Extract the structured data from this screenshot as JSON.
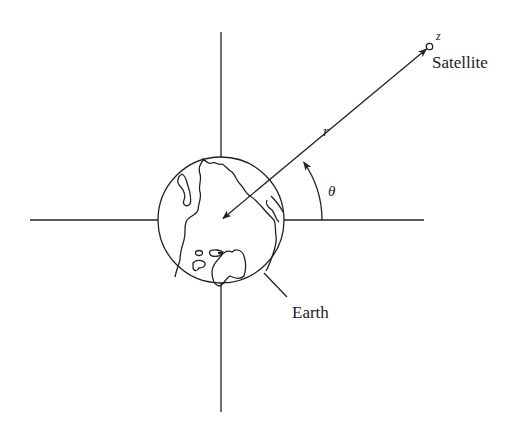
{
  "diagram": {
    "type": "satellite-geometry",
    "labels": {
      "satellite": "Satellite",
      "z": "z",
      "r": "r",
      "theta": "θ",
      "earth": "Earth"
    },
    "colors": {
      "stroke": "#222222",
      "background": "#ffffff"
    },
    "elements": {
      "vertical_axis": {
        "x": 221,
        "y1": 32,
        "y2": 412
      },
      "horizontal_axis": {
        "y": 220,
        "x1": 30,
        "x2": 424
      },
      "earth": {
        "cx": 221,
        "cy": 220,
        "r": 63
      },
      "satellite": {
        "cx": 429,
        "cy": 47,
        "r": 3.2
      },
      "radius_vector": {
        "from": "satellite",
        "to": "earth-center",
        "arrows": "both"
      },
      "angle_arc": {
        "center": [
          221,
          220
        ],
        "radius": 101,
        "from_deg": 0,
        "to_deg": 35
      }
    }
  }
}
